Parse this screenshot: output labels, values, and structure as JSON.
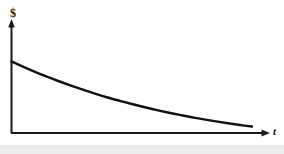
{
  "figure": {
    "name": "exponential-decay-graph",
    "background_color": "#ffffff",
    "line_color": "#111111",
    "axis_color": "#1a1a1a",
    "band_color": "#ebebeb"
  },
  "labels": {
    "y_axis": "$",
    "x_axis": "t"
  },
  "chart_data": {
    "type": "line",
    "title": "",
    "subtitle": "",
    "xlabel": "t",
    "ylabel": "$",
    "grid": false,
    "legend": false,
    "legend_position": "none",
    "xlim": [
      0,
      1
    ],
    "ylim": [
      0,
      1
    ],
    "axis_arrows": true,
    "tick_labels_x": [],
    "tick_labels_y": [],
    "annotations": [],
    "series": [
      {
        "name": "value-decay",
        "x": [
          0.0,
          0.05,
          0.1,
          0.15,
          0.2,
          0.25,
          0.3,
          0.35,
          0.4,
          0.45,
          0.5,
          0.55,
          0.6,
          0.65,
          0.7,
          0.75,
          0.8,
          0.85,
          0.9,
          0.95,
          1.0
        ],
        "y": [
          0.645,
          0.596,
          0.549,
          0.505,
          0.464,
          0.425,
          0.388,
          0.353,
          0.32,
          0.29,
          0.261,
          0.234,
          0.209,
          0.185,
          0.163,
          0.142,
          0.123,
          0.105,
          0.088,
          0.072,
          0.058
        ]
      }
    ]
  }
}
